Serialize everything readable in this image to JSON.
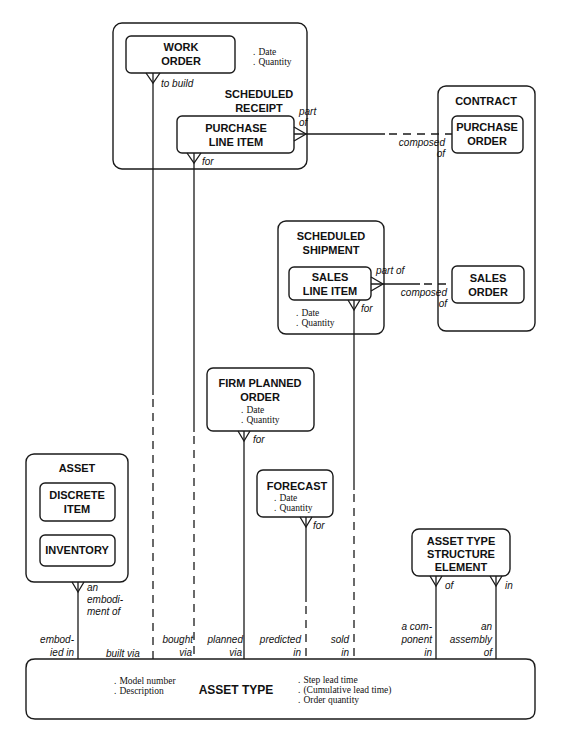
{
  "diagram": {
    "type": "entity-relationship",
    "entities": {
      "scheduled_receipt": {
        "label": [
          "SCHEDULED",
          "RECEIPT"
        ],
        "attributes": [
          "Date",
          "Quantity"
        ],
        "subtypes": {
          "work_order": {
            "label": [
              "WORK",
              "ORDER"
            ]
          },
          "purchase_line_item": {
            "label": [
              "PURCHASE",
              "LINE ITEM"
            ]
          }
        }
      },
      "contract": {
        "label": "CONTRACT",
        "subtypes": {
          "purchase_order": {
            "label": [
              "PURCHASE",
              "ORDER"
            ]
          },
          "sales_order": {
            "label": [
              "SALES",
              "ORDER"
            ]
          }
        }
      },
      "scheduled_shipment": {
        "label": [
          "SCHEDULED",
          "SHIPMENT"
        ],
        "subtypes": {
          "sales_line_item": {
            "label": [
              "SALES",
              "LINE ITEM"
            ]
          }
        },
        "attributes": [
          "Date",
          "Quantity"
        ]
      },
      "firm_planned_order": {
        "label": [
          "FIRM PLANNED",
          "ORDER"
        ],
        "attributes": [
          "Date",
          "Quantity"
        ]
      },
      "forecast": {
        "label": "FORECAST",
        "attributes": [
          "Date",
          "Quantity"
        ]
      },
      "asset": {
        "label": "ASSET",
        "subtypes": {
          "discrete_item": {
            "label": [
              "DISCRETE",
              "ITEM"
            ]
          },
          "inventory": {
            "label": "INVENTORY"
          }
        }
      },
      "asset_type_structure_element": {
        "label": [
          "ASSET TYPE",
          "STRUCTURE",
          "ELEMENT"
        ]
      },
      "asset_type": {
        "label": "ASSET TYPE",
        "attributes_left": [
          "Model number",
          "Description"
        ],
        "attributes_right": [
          "Step lead time",
          "(Cumulative lead time)",
          "Order quantity"
        ]
      }
    },
    "relationships": {
      "work_order_to_build": "to build",
      "purchase_line_item_part_of": [
        "part",
        "of"
      ],
      "purchase_line_item_for": "for",
      "purchase_order_composed_of": [
        "composed",
        "of"
      ],
      "sales_line_item_part_of": "part of",
      "sales_order_composed_of": [
        "composed",
        "of"
      ],
      "sales_line_item_for": "for",
      "firm_planned_order_for": "for",
      "forecast_for": "for",
      "asset_embodiment_of": [
        "an",
        "embodi-",
        "ment of"
      ],
      "asset_type_embodied_in": [
        "embod-",
        "ied in"
      ],
      "asset_type_built_via": "built via",
      "asset_type_bought_via": [
        "bought",
        "via"
      ],
      "asset_type_planned_via": [
        "planned",
        "via"
      ],
      "asset_type_predicted_in": [
        "predicted",
        "in"
      ],
      "asset_type_sold_in": [
        "sold",
        "in"
      ],
      "structure_element_of": "of",
      "structure_element_in": "in",
      "asset_type_component_in": [
        "a com-",
        "ponent",
        "in"
      ],
      "asset_type_assembly_of": [
        "an",
        "assembly",
        "of"
      ]
    },
    "bullet": "."
  }
}
